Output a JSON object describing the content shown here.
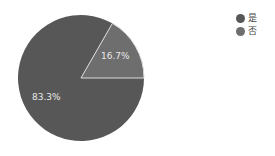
{
  "chart_data": {
    "type": "pie",
    "title": "",
    "categories": [
      "是",
      "否"
    ],
    "values": [
      83.3,
      16.7
    ],
    "labels": [
      "83.3%",
      "16.7%"
    ],
    "colors": [
      "#575757",
      "#6e6e6e"
    ],
    "legend_position": "top-right",
    "start_angle_deg": 0,
    "direction": "clockwise-from-3-oclock"
  },
  "legend": {
    "items": [
      {
        "label": "是",
        "color": "#575757"
      },
      {
        "label": "否",
        "color": "#6e6e6e"
      }
    ]
  },
  "slice_labels": {
    "yes": "83.3%",
    "no": "16.7%"
  }
}
